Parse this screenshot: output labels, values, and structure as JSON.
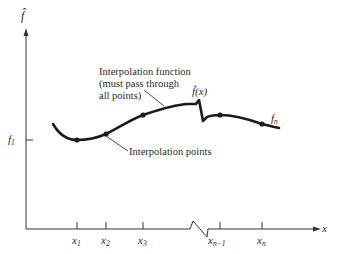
{
  "diagram": {
    "y_axis_label": "f̂",
    "x_axis_label": "x",
    "f1_label_base": "f",
    "f1_label_sub": "1",
    "fn_label_base": "f",
    "fn_label_sub": "n",
    "fhat_x_label": "f̂(x)",
    "annotations": {
      "interpolation_function_line1": "Interpolation function",
      "interpolation_function_line2": "(must pass through",
      "interpolation_function_line3": "all points)",
      "interpolation_points": "Interpolation points"
    },
    "x_ticks": [
      {
        "base": "x",
        "sub": "1"
      },
      {
        "base": "x",
        "sub": "2"
      },
      {
        "base": "x",
        "sub": "3"
      },
      {
        "base": "x",
        "sub": "n−1"
      },
      {
        "base": "x",
        "sub": "n"
      }
    ],
    "colors": {
      "ink": "#1a1a1a",
      "background": "#ffffff"
    }
  }
}
